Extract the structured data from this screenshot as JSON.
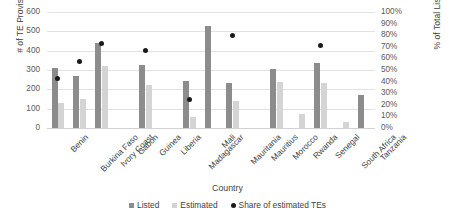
{
  "chart_data": {
    "type": "bar",
    "title": "",
    "xlabel": "Country",
    "ylabel": "# of TE Provisions",
    "ylabel_secondary": "% of Total Listed",
    "ylim": [
      0,
      600
    ],
    "ylim_secondary": [
      0,
      1
    ],
    "grid": true,
    "legend_position": "bottom",
    "categories": [
      "Benin",
      "Burkina Faso",
      "Ivory Coast",
      "Gabon",
      "Guinea",
      "Liberia",
      "Madagascar",
      "Mali",
      "Mauritania",
      "Mauritius",
      "Morocco",
      "Rwanda",
      "Senegal",
      "South Africa",
      "Tanzania"
    ],
    "yticks": [
      0,
      100,
      200,
      300,
      400,
      500,
      600
    ],
    "yticks_secondary": [
      "0%",
      "10%",
      "20%",
      "30%",
      "40%",
      "50%",
      "60%",
      "70%",
      "80%",
      "90%",
      "100%"
    ],
    "series": [
      {
        "name": "Listed",
        "type": "bar",
        "color": "#8c8c8c",
        "axis": "left",
        "values": [
          310,
          270,
          440,
          null,
          325,
          null,
          245,
          530,
          235,
          null,
          305,
          null,
          335,
          null,
          170
        ]
      },
      {
        "name": "Estimated",
        "type": "bar",
        "color": "#d4d4d4",
        "axis": "left",
        "values": [
          130,
          150,
          320,
          null,
          220,
          null,
          55,
          null,
          140,
          null,
          240,
          70,
          235,
          30,
          null
        ]
      },
      {
        "name": "Share of estimated TEs",
        "type": "scatter",
        "color": "#1a1a1a",
        "axis": "right",
        "values": [
          0.43,
          0.57,
          0.73,
          null,
          0.67,
          null,
          0.25,
          null,
          0.8,
          null,
          null,
          null,
          0.71,
          null,
          null
        ]
      }
    ]
  },
  "legend": {
    "items": [
      {
        "label": "Listed",
        "marker": "square-icon",
        "color": "#8c8c8c"
      },
      {
        "label": "Estimated",
        "marker": "square-icon",
        "color": "#d4d4d4"
      },
      {
        "label": "Share of estimated TEs",
        "marker": "circle-icon",
        "color": "#1a1a1a"
      }
    ]
  }
}
